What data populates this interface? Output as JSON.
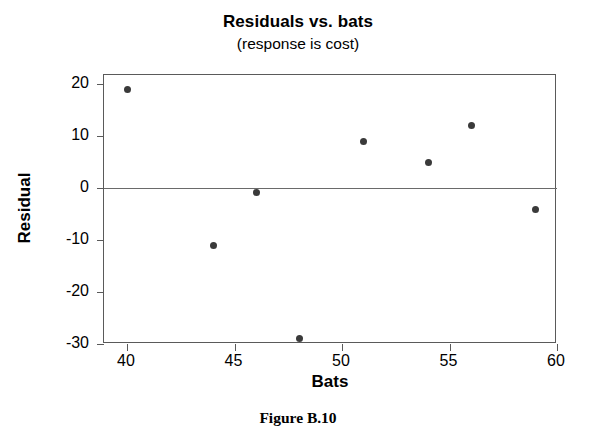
{
  "chart_data": {
    "type": "scatter",
    "title": "Residuals vs. bats",
    "subtitle": "(response is cost)",
    "xlabel": "Bats",
    "ylabel": "Residual",
    "caption": "Figure B.10",
    "xlim": [
      39,
      60
    ],
    "ylim": [
      -32,
      21
    ],
    "xticks": [
      40,
      45,
      50,
      55,
      60
    ],
    "xtick_labels": [
      "40",
      "45",
      "50",
      "55",
      "60"
    ],
    "yticks": [
      20,
      10,
      0,
      -10,
      -20,
      -30
    ],
    "ytick_labels": [
      "20",
      "10",
      "0",
      "-10",
      "-20",
      "-30"
    ],
    "grid": false,
    "legend": false,
    "reference_line": {
      "axis": "y",
      "value": 0
    },
    "marker_color": "#3a3a3a",
    "axis_color": "#5a5a5a",
    "points": [
      {
        "x": 40,
        "y": 19.0
      },
      {
        "x": 44,
        "y": -11.0
      },
      {
        "x": 46,
        "y": -0.8
      },
      {
        "x": 48,
        "y": -29.0
      },
      {
        "x": 51,
        "y": 9.0
      },
      {
        "x": 54,
        "y": 5.0
      },
      {
        "x": 56,
        "y": 12.0
      },
      {
        "x": 59,
        "y": -4.2
      }
    ]
  }
}
